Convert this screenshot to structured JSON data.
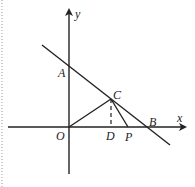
{
  "diagram": {
    "type": "coordinate-geometry",
    "axes": {
      "x_label": "x",
      "y_label": "y"
    },
    "points": {
      "O": {
        "label": "O"
      },
      "A": {
        "label": "A"
      },
      "B": {
        "label": "B"
      },
      "C": {
        "label": "C"
      },
      "D": {
        "label": "D"
      },
      "P": {
        "label": "P"
      }
    },
    "segments": [
      "AB line",
      "OC",
      "CP",
      "CD (dashed)"
    ],
    "colors": {
      "stroke": "#222222",
      "border": "#999999"
    }
  }
}
